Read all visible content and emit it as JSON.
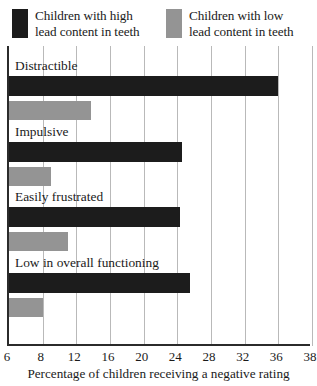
{
  "legend": {
    "entries": [
      {
        "label": "Children with high\nlead content in teeth",
        "color": "#1c1c1c",
        "swatch": "dark-swatch"
      },
      {
        "label": "Children with low\nlead content in teeth",
        "color": "#949494",
        "swatch": "gray-swatch"
      }
    ]
  },
  "chart_data": {
    "type": "bar",
    "orientation": "horizontal",
    "title": "",
    "xlabel": "Percentage of children receiving a negative rating",
    "ylabel": "",
    "categories": [
      "Distractible",
      "Impulsive",
      "Easily frustrated",
      "Low in overall functioning"
    ],
    "series": [
      {
        "name": "Children with high lead content in teeth",
        "color": "#1c1c1c",
        "values": [
          36.0,
          24.5,
          24.3,
          25.5
        ]
      },
      {
        "name": "Children with low lead content in teeth",
        "color": "#949494",
        "values": [
          13.8,
          9.0,
          11.0,
          8.0
        ]
      }
    ],
    "xlim": [
      6,
      38
    ],
    "xticks": [
      6,
      8,
      12,
      16,
      20,
      24,
      28,
      32,
      36,
      38
    ],
    "xtick_labels": [
      "6",
      "8",
      "12",
      "16",
      "20",
      "24",
      "28",
      "32",
      "36",
      "38"
    ],
    "grid": true,
    "grid_axis": "x",
    "legend_position": "top"
  }
}
